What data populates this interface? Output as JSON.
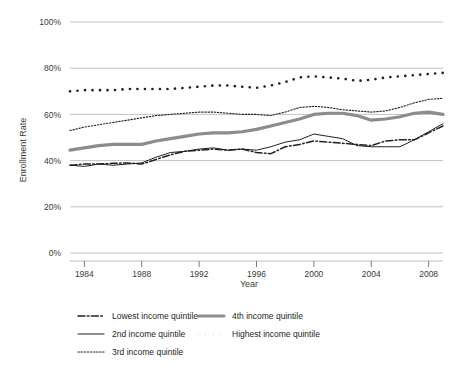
{
  "chart_data": {
    "type": "line",
    "title": "",
    "xlabel": "Year",
    "ylabel": "Enrollment Rate",
    "xlim": [
      1983,
      2009
    ],
    "ylim": [
      0,
      100
    ],
    "y_tick_labels": [
      "0%",
      "20%",
      "40%",
      "60%",
      "80%",
      "100%"
    ],
    "y_ticks": [
      0,
      20,
      40,
      60,
      80,
      100
    ],
    "x_tick_labels": [
      "1984",
      "1988",
      "1992",
      "1996",
      "2000",
      "2004",
      "2008"
    ],
    "x_ticks": [
      1984,
      1988,
      1992,
      1996,
      2000,
      2004,
      2008
    ],
    "grid": "horizontal",
    "legend_position": "below",
    "x": [
      1983,
      1984,
      1985,
      1986,
      1987,
      1988,
      1989,
      1990,
      1991,
      1992,
      1993,
      1994,
      1995,
      1996,
      1997,
      1998,
      1999,
      2000,
      2001,
      2002,
      2003,
      2004,
      2005,
      2006,
      2007,
      2008,
      2009
    ],
    "series": [
      {
        "name": "Lowest income quintile",
        "style": "dash-dot",
        "color": "#231f20",
        "width": 1.5,
        "values": [
          38.0,
          38.5,
          38.5,
          38.8,
          39.0,
          38.5,
          40.5,
          42.5,
          44.0,
          44.5,
          45.0,
          44.5,
          45.0,
          43.5,
          43.0,
          46.0,
          47.0,
          48.5,
          48.0,
          47.5,
          47.0,
          46.5,
          48.5,
          49.0,
          49.0,
          52.0,
          55.0
        ]
      },
      {
        "name": "2nd income quintile",
        "style": "solid",
        "color": "#231f20",
        "width": 1.0,
        "values": [
          38.0,
          37.5,
          38.5,
          38.0,
          38.5,
          39.0,
          41.5,
          43.5,
          44.0,
          45.0,
          45.5,
          44.5,
          45.0,
          44.5,
          46.0,
          48.0,
          49.0,
          51.5,
          50.5,
          49.5,
          46.5,
          46.0,
          46.0,
          46.0,
          49.0,
          52.5,
          56.0
        ]
      },
      {
        "name": "3rd income quintile",
        "style": "dotted-fine",
        "color": "#231f20",
        "width": 1.1,
        "values": [
          53.0,
          54.5,
          55.5,
          56.5,
          57.5,
          58.5,
          59.5,
          60.0,
          60.5,
          61.0,
          61.0,
          60.5,
          60.0,
          60.0,
          59.5,
          61.0,
          63.0,
          63.5,
          63.0,
          62.0,
          61.5,
          61.0,
          61.5,
          63.0,
          65.0,
          66.5,
          67.0
        ]
      },
      {
        "name": "4th income quintile",
        "style": "thick-solid",
        "color": "#8c8c8c",
        "width": 3.2,
        "values": [
          44.5,
          45.5,
          46.5,
          47.0,
          47.0,
          47.0,
          48.5,
          49.5,
          50.5,
          51.5,
          52.0,
          52.0,
          52.5,
          53.5,
          55.0,
          56.5,
          58.0,
          60.0,
          60.5,
          60.5,
          59.5,
          57.5,
          58.0,
          59.0,
          60.5,
          61.0,
          60.0
        ]
      },
      {
        "name": "Highest income quintile",
        "style": "square-dots",
        "color": "#231f20",
        "width": 2.6,
        "values": [
          70.0,
          70.5,
          70.5,
          70.5,
          71.0,
          71.0,
          71.0,
          71.0,
          71.5,
          72.0,
          72.5,
          72.5,
          72.0,
          71.5,
          72.5,
          74.0,
          76.0,
          76.5,
          76.0,
          75.5,
          74.5,
          75.0,
          76.0,
          76.5,
          77.0,
          77.5,
          78.0
        ]
      }
    ]
  },
  "legend": {
    "items": [
      {
        "label": "Lowest income quintile"
      },
      {
        "label": "4th income quintile"
      },
      {
        "label": "2nd income quintile"
      },
      {
        "label": "Highest income quintile"
      },
      {
        "label": "3rd income quintile"
      }
    ]
  }
}
